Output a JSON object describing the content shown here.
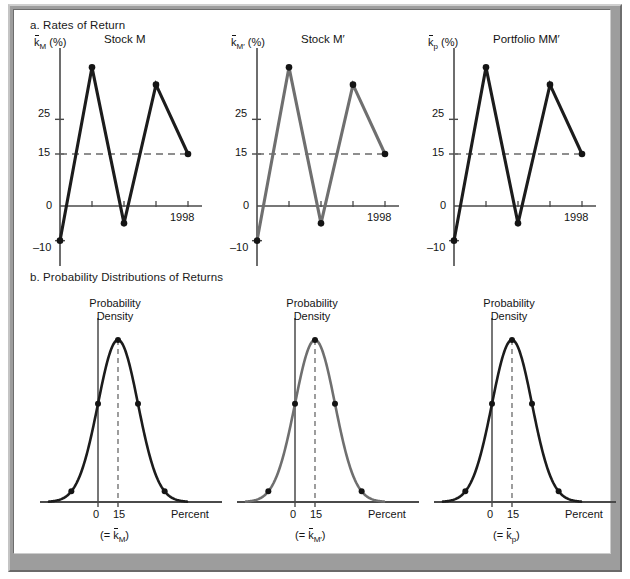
{
  "figure": {
    "section_a_title": "a. Rates of Return",
    "section_b_title": "b. Probability Distributions of Returns"
  },
  "colors": {
    "dark_line": "#1c1c1c",
    "gray_line": "#6f6f6f",
    "axis": "#4a4a4a",
    "dashed": "#6a6a6a",
    "frame": "#9d9d9d"
  },
  "panels_a": [
    {
      "id": "stock-m",
      "heading": "Stock M",
      "y_axis_label_base": "k",
      "y_axis_label_sub": "M",
      "y_axis_label_prime": "",
      "y_axis_label_suffix": "(%)",
      "color": "#1c1c1c",
      "x_end_label": "1998",
      "y_ticks": [
        {
          "label": "25",
          "value": 25
        },
        {
          "label": "15",
          "value": 15
        },
        {
          "label": "0",
          "value": 0
        },
        {
          "label": "–10",
          "value": -10
        }
      ]
    },
    {
      "id": "stock-m-prime",
      "heading": "Stock M′",
      "y_axis_label_base": "k",
      "y_axis_label_sub": "M′",
      "y_axis_label_prime": "",
      "y_axis_label_suffix": "(%)",
      "color": "#6f6f6f",
      "x_end_label": "1998",
      "y_ticks": [
        {
          "label": "25",
          "value": 25
        },
        {
          "label": "15",
          "value": 15
        },
        {
          "label": "0",
          "value": 0
        },
        {
          "label": "–10",
          "value": -10
        }
      ]
    },
    {
      "id": "portfolio-mm-prime",
      "heading": "Portfolio MM′",
      "y_axis_label_base": "k",
      "y_axis_label_sub": "p",
      "y_axis_label_prime": "",
      "y_axis_label_suffix": "(%)",
      "color": "#1c1c1c",
      "x_end_label": "1998",
      "y_ticks": [
        {
          "label": "25",
          "value": 25
        },
        {
          "label": "15",
          "value": 15
        },
        {
          "label": "0",
          "value": 0
        },
        {
          "label": "–10",
          "value": -10
        }
      ]
    }
  ],
  "panels_b": [
    {
      "id": "dist-m",
      "density_label_line1": "Probability",
      "density_label_line2": "Density",
      "color": "#1c1c1c",
      "x_ticks": [
        "0",
        "15"
      ],
      "x_axis_label": "Percent",
      "mean_label_prefix": "(= ",
      "mean_label_base": "k",
      "mean_label_sub": "M",
      "mean_label_suffix": ")"
    },
    {
      "id": "dist-m-prime",
      "density_label_line1": "Probability",
      "density_label_line2": "Density",
      "color": "#6f6f6f",
      "x_ticks": [
        "0",
        "15"
      ],
      "x_axis_label": "Percent",
      "mean_label_prefix": "(= ",
      "mean_label_base": "k",
      "mean_label_sub": "M′",
      "mean_label_suffix": ")"
    },
    {
      "id": "dist-p",
      "density_label_line1": "Probability",
      "density_label_line2": "Density",
      "color": "#1c1c1c",
      "x_ticks": [
        "0",
        "15"
      ],
      "x_axis_label": "Percent",
      "mean_label_prefix": "(= ",
      "mean_label_base": "k",
      "mean_label_sub": "p",
      "mean_label_suffix": ")"
    }
  ],
  "chart_data": [
    {
      "type": "line",
      "title": "Stock M",
      "xlabel": "Year",
      "ylabel": "k̄M (%)",
      "x": [
        1994,
        1995,
        1996,
        1997,
        1998
      ],
      "values": [
        -10,
        40,
        -5,
        35,
        15
      ],
      "ylim": [
        -15,
        45
      ],
      "yticks": [
        -10,
        0,
        15,
        25
      ],
      "reference_line": 15,
      "grid": false,
      "markers": true,
      "series_color": "#1c1c1c"
    },
    {
      "type": "line",
      "title": "Stock M′",
      "xlabel": "Year",
      "ylabel": "k̄M′ (%)",
      "x": [
        1994,
        1995,
        1996,
        1997,
        1998
      ],
      "values": [
        -10,
        40,
        -5,
        35,
        15
      ],
      "ylim": [
        -15,
        45
      ],
      "yticks": [
        -10,
        0,
        15,
        25
      ],
      "reference_line": 15,
      "grid": false,
      "markers": true,
      "series_color": "#6f6f6f"
    },
    {
      "type": "line",
      "title": "Portfolio MM′",
      "xlabel": "Year",
      "ylabel": "k̄p (%)",
      "x": [
        1994,
        1995,
        1996,
        1997,
        1998
      ],
      "values": [
        -10,
        40,
        -5,
        35,
        15
      ],
      "ylim": [
        -15,
        45
      ],
      "yticks": [
        -10,
        0,
        15,
        25
      ],
      "reference_line": 15,
      "grid": false,
      "markers": true,
      "series_color": "#1c1c1c"
    },
    {
      "type": "area",
      "title": "Probability Density (Stock M)",
      "xlabel": "Percent",
      "ylabel": "Probability Density",
      "distribution": "normal",
      "mean": 15,
      "std": 15,
      "xticks": [
        0,
        15
      ],
      "peak_marker": 15,
      "marker_points": [
        -20,
        0,
        30,
        50
      ],
      "series_color": "#1c1c1c"
    },
    {
      "type": "area",
      "title": "Probability Density (Stock M′)",
      "xlabel": "Percent",
      "ylabel": "Probability Density",
      "distribution": "normal",
      "mean": 15,
      "std": 15,
      "xticks": [
        0,
        15
      ],
      "peak_marker": 15,
      "marker_points": [
        -20,
        0,
        30,
        50
      ],
      "series_color": "#6f6f6f"
    },
    {
      "type": "area",
      "title": "Probability Density (Portfolio MM′)",
      "xlabel": "Percent",
      "ylabel": "Probability Density",
      "distribution": "normal",
      "mean": 15,
      "std": 15,
      "xticks": [
        0,
        15
      ],
      "peak_marker": 15,
      "marker_points": [
        -20,
        0,
        30,
        50
      ],
      "series_color": "#1c1c1c"
    }
  ]
}
